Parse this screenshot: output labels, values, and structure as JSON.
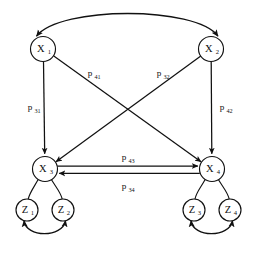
{
  "figure": {
    "type": "path-diagram",
    "background_color": "#ffffff",
    "stroke_color": "#111111",
    "node_fill_color": "#ffffff"
  },
  "nodes": [
    {
      "id": "x1",
      "label": "X",
      "subscript": "1",
      "cx": 43,
      "cy": 49,
      "r": 12.5,
      "tier": "latent"
    },
    {
      "id": "x2",
      "label": "X",
      "subscript": "2",
      "cx": 211,
      "cy": 49,
      "r": 12.5,
      "tier": "latent"
    },
    {
      "id": "x3",
      "label": "X",
      "subscript": "3",
      "cx": 45,
      "cy": 169,
      "r": 12.5,
      "tier": "latent"
    },
    {
      "id": "x4",
      "label": "X",
      "subscript": "4",
      "cx": 212,
      "cy": 169,
      "r": 12.5,
      "tier": "latent"
    },
    {
      "id": "z1",
      "label": "Z",
      "subscript": "1",
      "cx": 27,
      "cy": 210,
      "r": 11.0,
      "tier": "indicator"
    },
    {
      "id": "z2",
      "label": "Z",
      "subscript": "2",
      "cx": 63,
      "cy": 210,
      "r": 11.0,
      "tier": "indicator"
    },
    {
      "id": "z3",
      "label": "Z",
      "subscript": "3",
      "cx": 194,
      "cy": 210,
      "r": 11.0,
      "tier": "indicator"
    },
    {
      "id": "z4",
      "label": "Z",
      "subscript": "4",
      "cx": 230,
      "cy": 210,
      "r": 11.0,
      "tier": "indicator"
    }
  ],
  "edges": [
    {
      "id": "e-x1-x3",
      "from": "x1",
      "to": "x3",
      "kind": "directed-straight",
      "label": "p",
      "label_sub": "31",
      "label_x": 32,
      "label_y": 110
    },
    {
      "id": "e-x2-x4",
      "from": "x2",
      "to": "x4",
      "kind": "directed-straight",
      "label": "p",
      "label_sub": "42",
      "label_x": 224,
      "label_y": 110
    },
    {
      "id": "e-x1-x4",
      "from": "x1",
      "to": "x4",
      "kind": "directed-diagonal",
      "label": "p",
      "label_sub": "41",
      "label_x": 94,
      "label_y": 76
    },
    {
      "id": "e-x2-x3",
      "from": "x2",
      "to": "x3",
      "kind": "directed-diagonal",
      "label": "p",
      "label_sub": "32",
      "label_x": 163,
      "label_y": 76
    },
    {
      "id": "e-x3-x4",
      "from": "x3",
      "to": "x4",
      "kind": "directed-horizontal",
      "label": "p",
      "label_sub": "43",
      "label_x": 128,
      "label_y": 160
    },
    {
      "id": "e-x4-x3",
      "from": "x4",
      "to": "x3",
      "kind": "directed-horizontal",
      "label": "p",
      "label_sub": "34",
      "label_x": 128,
      "label_y": 189
    }
  ],
  "correlations": [
    {
      "id": "c-x1-x2",
      "between": [
        "x1",
        "x2"
      ],
      "kind": "double-headed-arc",
      "position": "above"
    },
    {
      "id": "c-z1-z2",
      "between": [
        "z1",
        "z2"
      ],
      "kind": "double-headed-arc",
      "position": "below"
    },
    {
      "id": "c-z3-z4",
      "between": [
        "z3",
        "z4"
      ],
      "kind": "double-headed-arc",
      "position": "below"
    }
  ],
  "measurement_links": [
    {
      "id": "m-x3-z1",
      "from": "x3",
      "to": "z1",
      "kind": "undirected-curve"
    },
    {
      "id": "m-x3-z2",
      "from": "x3",
      "to": "z2",
      "kind": "undirected-curve"
    },
    {
      "id": "m-x4-z3",
      "from": "x4",
      "to": "z3",
      "kind": "undirected-curve"
    },
    {
      "id": "m-x4-z4",
      "from": "x4",
      "to": "z4",
      "kind": "undirected-curve"
    }
  ]
}
